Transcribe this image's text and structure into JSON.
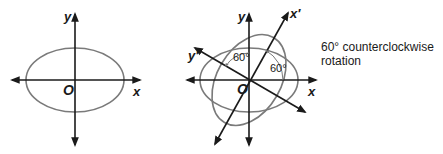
{
  "left_diagram": {
    "labels": {
      "y_axis": "y",
      "x_axis": "x",
      "origin": "O"
    }
  },
  "right_diagram": {
    "labels": {
      "y_axis": "y",
      "x_axis": "x",
      "x_prime_axis": "x′",
      "y_prime_axis": "y′",
      "origin": "O",
      "angle_1": "60°",
      "angle_2": "60°"
    }
  },
  "caption": {
    "line1": "60° counterclockwise",
    "line2": "rotation"
  },
  "colors": {
    "axis": "#1a1a1a",
    "ellipse": "#7a7a7a"
  }
}
